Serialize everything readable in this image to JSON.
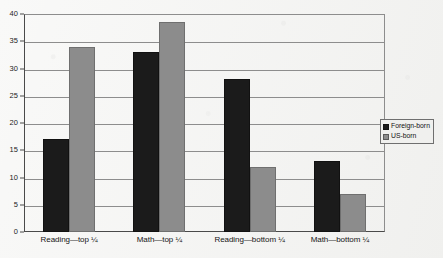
{
  "chart_data": {
    "type": "bar",
    "title": "",
    "subtitle": "",
    "xlabel": "",
    "ylabel": "",
    "ylim": [
      0,
      40
    ],
    "ytick_values": [
      0,
      5,
      10,
      15,
      20,
      25,
      30,
      35,
      40
    ],
    "ytick_labels": [
      "0",
      "5",
      "10",
      "15",
      "20",
      "25",
      "30",
      "35",
      "40"
    ],
    "grid": true,
    "legend_position": "right",
    "categories": [
      "Reading—top ¼",
      "Math—top ¼",
      "Reading—bottom ¼",
      "Math—bottom ¼"
    ],
    "series": [
      {
        "name": "Foreign-born",
        "color": "#1b1b1b",
        "values": [
          17,
          33,
          28,
          13
        ]
      },
      {
        "name": "US-born",
        "color": "#8c8c8c",
        "values": [
          34,
          38.5,
          12,
          7
        ]
      }
    ],
    "annotations": []
  },
  "legend": {
    "entries": [
      {
        "label": "Foreign-born",
        "swatch": "black-square-icon"
      },
      {
        "label": "US-born",
        "swatch": "gray-square-icon"
      }
    ]
  },
  "colors": {
    "foreign_born": "#1b1b1b",
    "us_born": "#8c8c8c",
    "axis": "#4a4a4a",
    "gridline": "#8d8d8d",
    "background": "#f3f3f1"
  }
}
